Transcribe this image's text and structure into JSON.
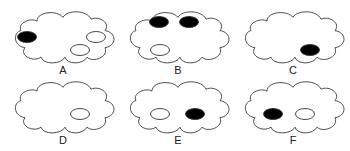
{
  "figure": {
    "panels": [
      {
        "label": "A",
        "x": 5,
        "y": 0,
        "holes": [
          {
            "cx": 22,
            "cy": 37,
            "filled": true
          },
          {
            "cx": 91,
            "cy": 37,
            "filled": false
          },
          {
            "cx": 75,
            "cy": 50,
            "filled": false
          }
        ]
      },
      {
        "label": "B",
        "x": 120,
        "y": 0,
        "holes": [
          {
            "cx": 39,
            "cy": 22,
            "filled": true
          },
          {
            "cx": 69,
            "cy": 22,
            "filled": true
          },
          {
            "cx": 40,
            "cy": 50,
            "filled": false
          }
        ]
      },
      {
        "label": "C",
        "x": 235,
        "y": 0,
        "holes": [
          {
            "cx": 75,
            "cy": 50,
            "filled": true
          }
        ]
      },
      {
        "label": "D",
        "x": 5,
        "y": 75,
        "holes": [
          {
            "cx": 75,
            "cy": 44,
            "filled": false
          }
        ]
      },
      {
        "label": "E",
        "x": 120,
        "y": 75,
        "holes": [
          {
            "cx": 40,
            "cy": 44,
            "filled": false
          },
          {
            "cx": 75,
            "cy": 44,
            "filled": true
          }
        ]
      },
      {
        "label": "F",
        "x": 235,
        "y": 75,
        "holes": [
          {
            "cx": 38,
            "cy": 44,
            "filled": true
          },
          {
            "cx": 70,
            "cy": 44,
            "filled": false
          }
        ]
      }
    ],
    "colors": {
      "stroke": "#333333",
      "fill": "#000000",
      "background": "#ffffff"
    }
  }
}
